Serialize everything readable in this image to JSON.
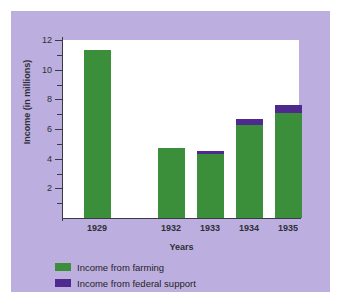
{
  "chart_data": {
    "type": "bar",
    "title": "",
    "subtitle": "",
    "xlabel": "Years",
    "ylabel": "Income (in millions)",
    "categories": [
      "1929",
      "1932",
      "1933",
      "1934",
      "1935"
    ],
    "series": [
      {
        "name": "Income from farming",
        "color": "#3c8f3a",
        "values": [
          11.3,
          4.7,
          4.3,
          6.3,
          7.1
        ]
      },
      {
        "name": "Income from federal support",
        "color": "#4e2a8e",
        "values": [
          0,
          0,
          0.2,
          0.4,
          0.5
        ]
      }
    ],
    "totals": [
      11.3,
      4.7,
      4.5,
      6.7,
      7.6
    ],
    "stacked": true,
    "ylim": [
      0,
      12
    ],
    "ytick_labels": [
      "2",
      "4",
      "6",
      "8",
      "10",
      "12"
    ],
    "ytick_values": [
      2,
      4,
      6,
      8,
      10,
      12
    ],
    "yminor_values": [
      1,
      3,
      5,
      7,
      9,
      11
    ],
    "grid": false,
    "legend_position": "below-left",
    "plot_background": "#ffffff",
    "figure_background": "#bcaede",
    "axis_color": "#3a3a44"
  },
  "legend": {
    "items": [
      {
        "label": "Income from farming",
        "color": "#3c8f3a"
      },
      {
        "label": "Income from federal support",
        "color": "#4e2a8e"
      }
    ]
  }
}
